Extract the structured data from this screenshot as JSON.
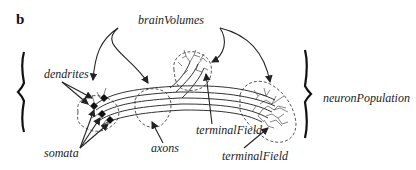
{
  "figure": {
    "panel_label": "b",
    "labels": {
      "brain_volumes": "brainVolumes",
      "dendrites": "dendrites",
      "somata": "somata",
      "axons": "axons",
      "terminal_field_1": "terminalField",
      "terminal_field_2": "terminalField",
      "neuron_population": "neuronPopulation"
    },
    "colors": {
      "ink": "#222222",
      "background": "#ffffff"
    }
  }
}
